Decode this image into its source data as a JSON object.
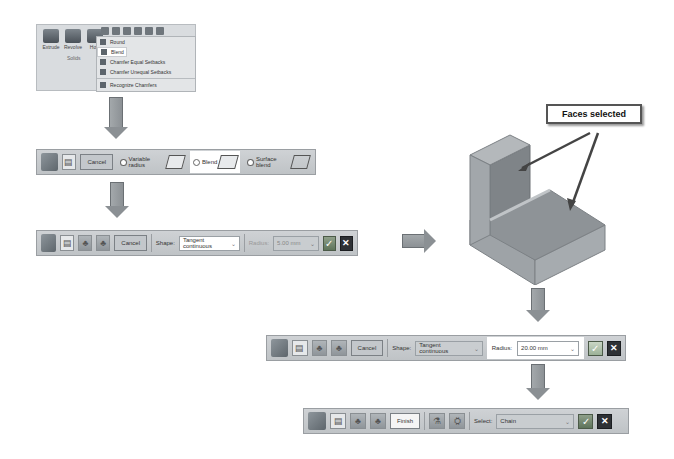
{
  "ribbon": {
    "buttons": [
      {
        "label": "Extrude",
        "icon": "extrude-icon"
      },
      {
        "label": "Revolve",
        "icon": "revolve-icon"
      },
      {
        "label": "Hole",
        "icon": "hole-icon"
      }
    ],
    "group_label": "Solids",
    "menu_items": [
      {
        "label": "Round",
        "icon": "round-icon"
      },
      {
        "label": "Blend",
        "icon": "blend-icon",
        "selected": true
      },
      {
        "label": "Chamfer Equal Setbacks",
        "icon": "chamfer-equal-icon"
      },
      {
        "label": "Chamfer Unequal Setbacks",
        "icon": "chamfer-unequal-icon"
      },
      {
        "label": "Recognize Chamfers",
        "icon": "recognize-chamfers-icon"
      }
    ]
  },
  "toolbar1": {
    "cancel_label": "Cancel",
    "options": [
      {
        "label": "Variable radius",
        "active": false
      },
      {
        "label": "Blend",
        "active": true
      },
      {
        "label": "Surface blend",
        "active": false
      }
    ]
  },
  "toolbar2": {
    "cancel_label": "Cancel",
    "shape_label": "Shape:",
    "shape_value": "Tangent continuous",
    "radius_label": "Radius:",
    "radius_value": "5.00 mm"
  },
  "callout": {
    "label": "Faces selected"
  },
  "toolbar3": {
    "cancel_label": "Cancel",
    "shape_label": "Shape:",
    "shape_value": "Tangent continuous",
    "radius_label": "Radius:",
    "radius_value": "20.00 mm"
  },
  "toolbar4": {
    "finish_label": "Finish",
    "select_label": "Select:",
    "select_value": "Chain"
  },
  "colors": {
    "toolbar_bg": "#c7cbce",
    "model_face": "#9a9fa3",
    "arrow": "#8b9094",
    "confirm": "#6e8569"
  }
}
